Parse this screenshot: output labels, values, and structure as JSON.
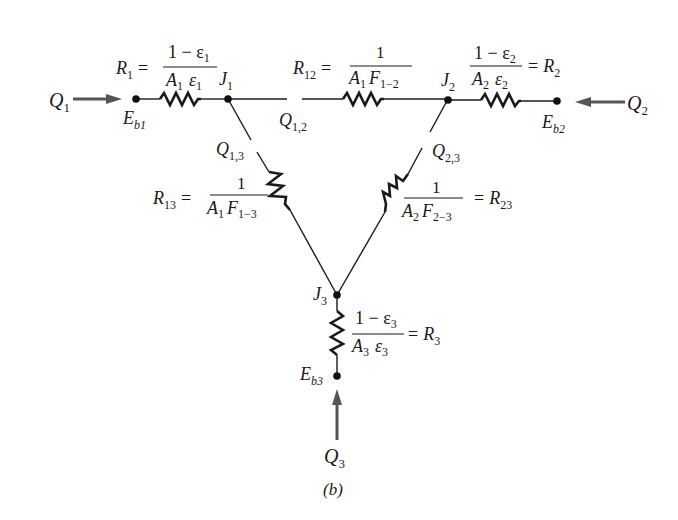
{
  "figure": {
    "caption": "(b)",
    "nodes": {
      "Eb1": {
        "base": "E",
        "sub": "b1"
      },
      "Eb2": {
        "base": "E",
        "sub": "b2"
      },
      "Eb3": {
        "base": "E",
        "sub": "b3"
      },
      "J1": {
        "base": "J",
        "sub": "1"
      },
      "J2": {
        "base": "J",
        "sub": "2"
      },
      "J3": {
        "base": "J",
        "sub": "3"
      }
    },
    "heat_flows": {
      "Q1": {
        "base": "Q",
        "sub": "1"
      },
      "Q2": {
        "base": "Q",
        "sub": "2"
      },
      "Q3": {
        "base": "Q",
        "sub": "3"
      },
      "Q12": {
        "base": "Q",
        "sub": "1,2"
      },
      "Q13": {
        "base": "Q",
        "sub": "1,3"
      },
      "Q23": {
        "base": "Q",
        "sub": "2,3"
      }
    },
    "resistances": {
      "R1": {
        "name": "R",
        "sub": "1",
        "eq": "=",
        "num_a": "1 − ε",
        "num_sub": "1",
        "den_a": "A",
        "den_a_sub": "1",
        "den_b": "ε",
        "den_b_sub": "1"
      },
      "R2": {
        "name": "R",
        "sub": "2",
        "eq": "=",
        "num_a": "1 − ε",
        "num_sub": "2",
        "den_a": "A",
        "den_a_sub": "2",
        "den_b": "ε",
        "den_b_sub": "2"
      },
      "R3": {
        "name": "R",
        "sub": "3",
        "eq": "=",
        "num_a": "1 − ε",
        "num_sub": "3",
        "den_a": "A",
        "den_a_sub": "3",
        "den_b": "ε",
        "den_b_sub": "3"
      },
      "R12": {
        "name": "R",
        "sub": "12",
        "eq": "=",
        "num": "1",
        "den_a": "A",
        "den_a_sub": "1",
        "den_b": "F",
        "den_b_sub": "1−2"
      },
      "R13": {
        "name": "R",
        "sub": "13",
        "eq": "=",
        "num": "1",
        "den_a": "A",
        "den_a_sub": "1",
        "den_b": "F",
        "den_b_sub": "1−3"
      },
      "R23": {
        "name": "R",
        "sub": "23",
        "eq": "=",
        "num": "1",
        "den_a": "A",
        "den_a_sub": "2",
        "den_b": "F",
        "den_b_sub": "2−3"
      }
    }
  }
}
